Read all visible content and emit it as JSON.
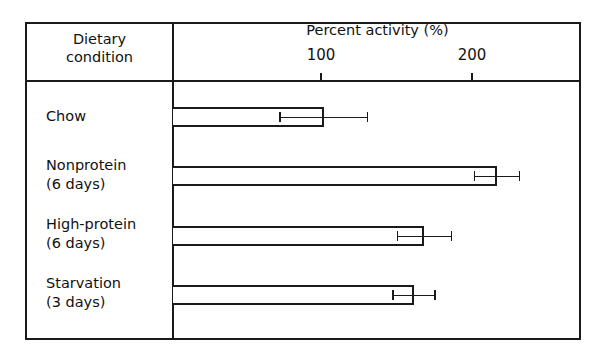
{
  "chart_data": {
    "type": "bar",
    "orientation": "horizontal",
    "title": "",
    "xlabel": "Percent activity (%)",
    "ylabel": "Dietary condition",
    "categories": [
      "Chow",
      "Nonprotein (6 days)",
      "High-protein (6 days)",
      "Starvation (3 days)"
    ],
    "values": [
      100,
      215,
      167,
      160
    ],
    "error": [
      29,
      15,
      18,
      14
    ],
    "xticks": [
      100,
      200
    ],
    "xlim": [
      0,
      272
    ],
    "grid": false,
    "legend": null
  },
  "header": {
    "left_line1": "Dietary",
    "left_line2": "condition",
    "axis_title": "Percent activity (%)",
    "tick_100": "100",
    "tick_200": "200"
  },
  "rows": [
    {
      "line1": "Chow",
      "line2": ""
    },
    {
      "line1": "Nonprotein",
      "line2": "(6 days)"
    },
    {
      "line1": "High-protein",
      "line2": "(6 days)"
    },
    {
      "line1": "Starvation",
      "line2": "(3 days)"
    }
  ]
}
